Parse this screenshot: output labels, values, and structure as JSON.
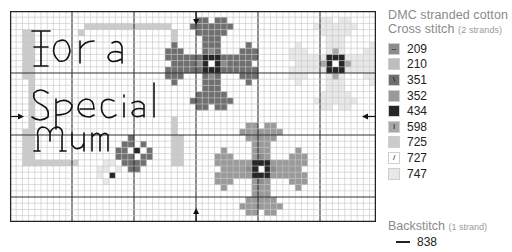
{
  "chart": {
    "title_text": [
      "For a",
      "Special",
      "Mum"
    ],
    "grid": {
      "cols": 59,
      "rows": 34,
      "cell": 6.2,
      "major_every": 10,
      "major_offset_x": 0,
      "major_offset_y": 0
    },
    "center_markers": {
      "top_arrow_col": 30,
      "left_arrow_row": 17
    }
  },
  "legend": {
    "title_line1": "DMC stranded cotton",
    "title_line2": "Cross stitch",
    "title_line2_note": "(2 strands)",
    "items": [
      {
        "code": "209",
        "color": "#8c8c8c",
        "symbol": "–"
      },
      {
        "code": "210",
        "color": "#bdbdbd",
        "symbol": ""
      },
      {
        "code": "351",
        "color": "#6f6f6f",
        "symbol": "\\"
      },
      {
        "code": "352",
        "color": "#9a9a9a",
        "symbol": ""
      },
      {
        "code": "434",
        "color": "#262626",
        "symbol": ""
      },
      {
        "code": "598",
        "color": "#a8a8a8",
        "symbol": "I"
      },
      {
        "code": "725",
        "color": "#cbcbcb",
        "symbol": ""
      },
      {
        "code": "727",
        "color": "#ffffff",
        "symbol": "/"
      },
      {
        "code": "747",
        "color": "#e8e8e8",
        "symbol": ""
      }
    ]
  },
  "backstitch": {
    "title": "Backstitch",
    "note": "(1 strand)",
    "code": "838"
  }
}
